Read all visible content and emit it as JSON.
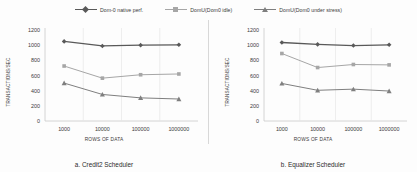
{
  "figure": {
    "background": "#fdfdfd",
    "legend": {
      "position": "top-center",
      "entries": [
        {
          "label": "Dom-0 native perf.",
          "color": "#595959",
          "marker": "diamond"
        },
        {
          "label": "DomU(Dom0 idle)",
          "color": "#a6a6a6",
          "marker": "square"
        },
        {
          "label": "DomU(Dom0 under stress)",
          "color": "#7f7f7f",
          "marker": "triangle"
        }
      ]
    }
  },
  "chart_data": [
    {
      "type": "line",
      "title": "a. Credit2 Scheduler",
      "xlabel": "ROWS OF DATA",
      "ylabel": "TRANSACTIONS/SEC",
      "categories": [
        "1000",
        "10000",
        "100000",
        "1000000"
      ],
      "yticks": [
        "0",
        "200",
        "400",
        "600",
        "800",
        "1000",
        "1200"
      ],
      "ylim": [
        0,
        1200
      ],
      "grid": "vertical",
      "legend_position": "shared-top",
      "series": [
        {
          "name": "Dom-0 native perf.",
          "color": "#595959",
          "marker": "diamond",
          "values": [
            1050,
            990,
            1000,
            1005
          ]
        },
        {
          "name": "DomU(Dom0 idle)",
          "color": "#a6a6a6",
          "marker": "square",
          "values": [
            725,
            565,
            610,
            620
          ]
        },
        {
          "name": "DomU(Dom0 under stress)",
          "color": "#7f7f7f",
          "marker": "triangle",
          "values": [
            500,
            350,
            305,
            290
          ]
        }
      ]
    },
    {
      "type": "line",
      "title": "b. Equalizer Scheduler",
      "xlabel": "ROWS OF DATA",
      "ylabel": "TRANSACTIONS/SEC",
      "categories": [
        "1000",
        "10000",
        "100000",
        "1000000"
      ],
      "yticks": [
        "0",
        "200",
        "400",
        "600",
        "800",
        "1000",
        "1200"
      ],
      "ylim": [
        0,
        1200
      ],
      "grid": "vertical",
      "legend_position": "shared-top",
      "series": [
        {
          "name": "Dom-0 native perf.",
          "color": "#595959",
          "marker": "diamond",
          "values": [
            1035,
            1010,
            995,
            1005
          ]
        },
        {
          "name": "DomU(Dom0 idle)",
          "color": "#a6a6a6",
          "marker": "square",
          "values": [
            890,
            705,
            745,
            740
          ]
        },
        {
          "name": "DomU(Dom0 under stress)",
          "color": "#7f7f7f",
          "marker": "triangle",
          "values": [
            495,
            405,
            420,
            395
          ]
        }
      ]
    }
  ]
}
